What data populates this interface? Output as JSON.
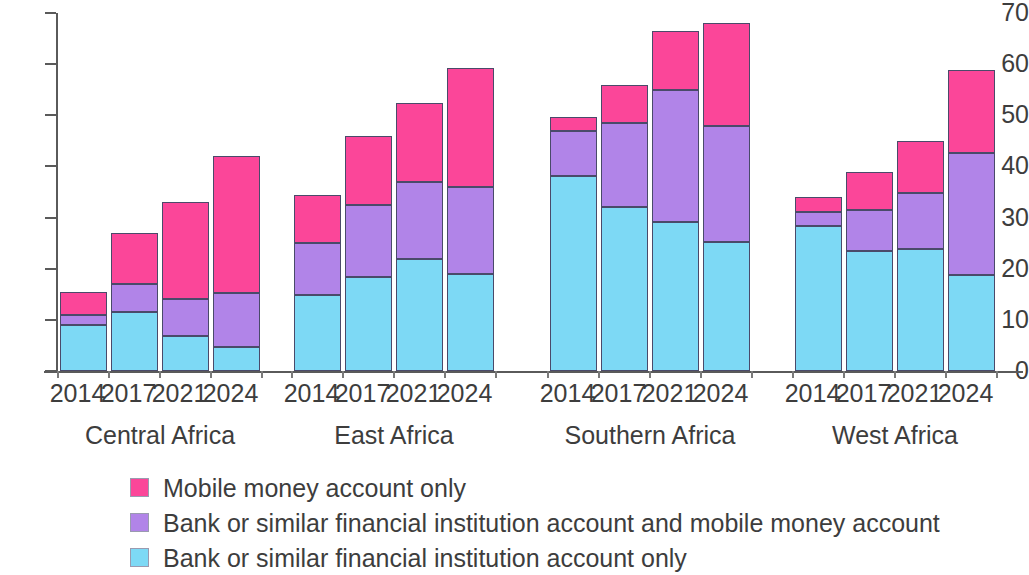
{
  "chart_data": {
    "type": "bar",
    "subtype": "stacked-bar-grouped",
    "title": "",
    "subtitle": "",
    "xlabel": "",
    "ylabel": "",
    "ylim": [
      0,
      70
    ],
    "yticks": [
      0,
      10,
      20,
      30,
      40,
      50,
      60,
      70
    ],
    "ytick_labels": [
      "0",
      "10",
      "20",
      "30",
      "40",
      "50",
      "60",
      "70"
    ],
    "grid": false,
    "legend_position": "bottom-left",
    "groups": [
      "Central Africa",
      "East Africa",
      "Southern Africa",
      "West Africa"
    ],
    "categories": [
      "2014",
      "2017",
      "2021",
      "2024"
    ],
    "series": [
      {
        "name": "Bank or similar financial institution account only",
        "color": "#7DD9F5",
        "values": {
          "Central Africa": [
            9.0,
            11.6,
            6.8,
            4.6
          ],
          "East Africa": [
            14.8,
            18.3,
            21.9,
            18.9
          ],
          "Southern Africa": [
            38.2,
            32.1,
            29.1,
            25.3
          ],
          "West Africa": [
            28.3,
            23.4,
            23.9,
            18.7
          ]
        }
      },
      {
        "name": "Bank or similar financial institution account and mobile money account",
        "color": "#B184E8",
        "values": {
          "Central Africa": [
            2.0,
            5.4,
            7.2,
            10.7
          ],
          "East Africa": [
            10.2,
            14.2,
            15.1,
            17.1
          ],
          "Southern Africa": [
            8.8,
            16.4,
            25.9,
            22.7
          ],
          "West Africa": [
            2.8,
            8.1,
            10.9,
            24.0
          ]
        }
      },
      {
        "name": "Mobile money account only",
        "color": "#FB4699",
        "values": {
          "Central Africa": [
            4.5,
            10.0,
            19.0,
            26.8
          ],
          "East Africa": [
            9.4,
            13.5,
            15.5,
            23.3
          ],
          "Southern Africa": [
            2.6,
            7.5,
            11.5,
            20.0
          ],
          "West Africa": [
            2.9,
            7.5,
            10.2,
            16.1
          ]
        }
      }
    ],
    "stack_totals": {
      "Central Africa": [
        15.5,
        27.0,
        33.0,
        42.1
      ],
      "East Africa": [
        34.4,
        46.0,
        52.5,
        59.3
      ],
      "Southern Africa": [
        49.6,
        56.0,
        66.5,
        68.0
      ],
      "West Africa": [
        34.0,
        39.0,
        45.0,
        58.8
      ]
    }
  },
  "axis": {
    "y_ticks": [
      "70",
      "60",
      "50",
      "40",
      "30",
      "20",
      "10",
      "0"
    ]
  },
  "groups": [
    {
      "label": "Central Africa",
      "bars": [
        {
          "year": "2014",
          "blue": 9.0,
          "purple": 2.0,
          "pink": 4.5,
          "total": 15.5
        },
        {
          "year": "2017",
          "blue": 11.6,
          "purple": 5.4,
          "pink": 10.0,
          "total": 27.0
        },
        {
          "year": "2021",
          "blue": 6.8,
          "purple": 7.2,
          "pink": 19.0,
          "total": 33.0
        },
        {
          "year": "2024",
          "blue": 4.6,
          "purple": 10.7,
          "pink": 26.8,
          "total": 42.1
        }
      ]
    },
    {
      "label": "East Africa",
      "bars": [
        {
          "year": "2014",
          "blue": 14.8,
          "purple": 10.2,
          "pink": 9.4,
          "total": 34.4
        },
        {
          "year": "2017",
          "blue": 18.3,
          "purple": 14.2,
          "pink": 13.5,
          "total": 46.0
        },
        {
          "year": "2021",
          "blue": 21.9,
          "purple": 15.1,
          "pink": 15.5,
          "total": 52.5
        },
        {
          "year": "2024",
          "blue": 18.9,
          "purple": 17.1,
          "pink": 23.3,
          "total": 59.3
        }
      ]
    },
    {
      "label": "Southern Africa",
      "bars": [
        {
          "year": "2014",
          "blue": 38.2,
          "purple": 8.8,
          "pink": 2.6,
          "total": 49.6
        },
        {
          "year": "2017",
          "blue": 32.1,
          "purple": 16.4,
          "pink": 7.5,
          "total": 56.0
        },
        {
          "year": "2021",
          "blue": 29.1,
          "purple": 25.9,
          "pink": 11.5,
          "total": 66.5
        },
        {
          "year": "2024",
          "blue": 25.3,
          "purple": 22.7,
          "pink": 20.0,
          "total": 68.0
        }
      ]
    },
    {
      "label": "West Africa",
      "bars": [
        {
          "year": "2014",
          "blue": 28.3,
          "purple": 2.8,
          "pink": 2.9,
          "total": 34.0
        },
        {
          "year": "2017",
          "blue": 23.4,
          "purple": 8.1,
          "pink": 7.5,
          "total": 39.0
        },
        {
          "year": "2021",
          "blue": 23.9,
          "purple": 10.9,
          "pink": 10.2,
          "total": 45.0
        },
        {
          "year": "2024",
          "blue": 18.7,
          "purple": 24.0,
          "pink": 16.1,
          "total": 58.8
        }
      ]
    }
  ],
  "legend": {
    "items": [
      {
        "label": "Mobile money account only",
        "color": "#FB4699",
        "key": "pink"
      },
      {
        "label": "Bank or similar financial institution account and mobile money account",
        "color": "#B184E8",
        "key": "purple"
      },
      {
        "label": "Bank or similar financial institution account only",
        "color": "#7DD9F5",
        "key": "blue"
      }
    ]
  },
  "colors": {
    "pink": "#FB4699",
    "purple": "#B184E8",
    "blue": "#7DD9F5",
    "axis": "#5a5a5a",
    "text": "#3d3d3d",
    "segment_border": "#4a4a6a"
  }
}
